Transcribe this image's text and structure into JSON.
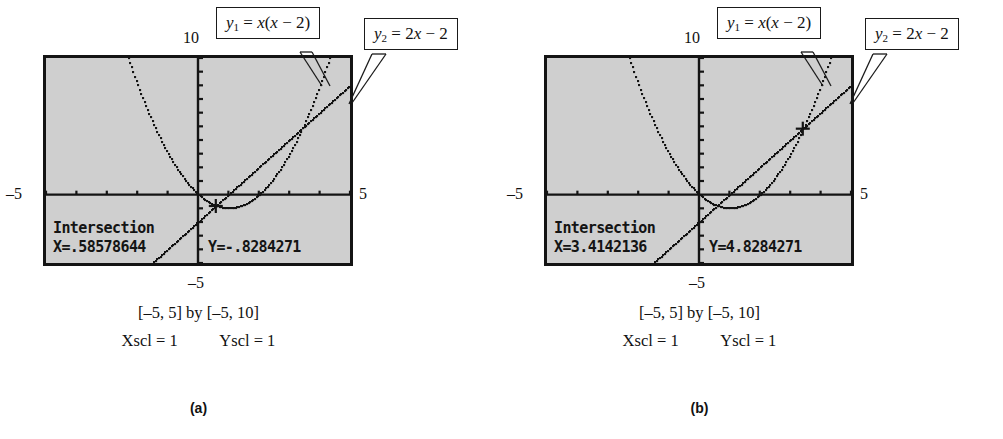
{
  "figures": [
    {
      "id": "a",
      "label": "(a)",
      "axis": {
        "ymax": "10",
        "xmin": "–5",
        "xmax": "5",
        "ymin": "–5"
      },
      "callouts": [
        {
          "name": "y1",
          "text": "y₁ = x(x − 2)",
          "var": "y",
          "sub": "1",
          "rhs": "= x(x − 2)"
        },
        {
          "name": "y2",
          "text": "y₂ = 2x − 2",
          "var": "y",
          "sub": "2",
          "rhs": "= 2x − 2"
        }
      ],
      "readout": {
        "title": "Intersection",
        "x": "X=.58578644",
        "y": "Y=-.8284271"
      },
      "caption": {
        "window": "[–5, 5]  by  [–5, 10]",
        "xscl": "Xscl = 1",
        "yscl": "Yscl = 1"
      },
      "cursor": {
        "x": 0.58578644,
        "y": -0.8284271
      }
    },
    {
      "id": "b",
      "label": "(b)",
      "axis": {
        "ymax": "10",
        "xmin": "–5",
        "xmax": "5",
        "ymin": "–5"
      },
      "callouts": [
        {
          "name": "y1",
          "text": "y₁ = x(x − 2)",
          "var": "y",
          "sub": "1",
          "rhs": "= x(x − 2)"
        },
        {
          "name": "y2",
          "text": "y₂ = 2x − 2",
          "var": "y",
          "sub": "2",
          "rhs": "= 2x − 2"
        }
      ],
      "readout": {
        "title": "Intersection",
        "x": "X=3.4142136",
        "y": "Y=4.8284271"
      },
      "caption": {
        "window": "[–5, 5]  by  [–5, 10]",
        "xscl": "Xscl = 1",
        "yscl": "Yscl = 1"
      },
      "cursor": {
        "x": 3.4142136,
        "y": 4.8284271
      }
    }
  ],
  "chart_data": {
    "type": "line",
    "xlabel": "x",
    "ylabel": "y",
    "xlim": [
      -5,
      5
    ],
    "ylim": [
      -5,
      10
    ],
    "xscl": 1,
    "yscl": 1,
    "grid": false,
    "legend": [
      "y₁ = x(x − 2)",
      "y₂ = 2x − 2"
    ],
    "series": [
      {
        "name": "y1 = x(x - 2)",
        "equation": "y = x(x-2)",
        "style": "dotted-pixel"
      },
      {
        "name": "y2 = 2x - 2",
        "equation": "y = 2x-2",
        "style": "dotted-pixel"
      }
    ],
    "intersections": [
      {
        "panel": "a",
        "x": 0.58578644,
        "y": -0.8284271
      },
      {
        "panel": "b",
        "x": 3.4142136,
        "y": 4.8284271
      }
    ]
  },
  "colors": {
    "screen_fill": "#cfcfcf",
    "ink": "#141414",
    "page": "#ffffff"
  }
}
